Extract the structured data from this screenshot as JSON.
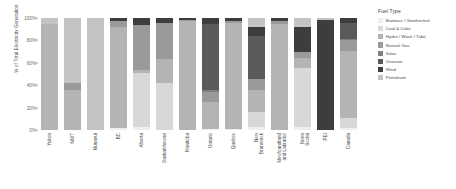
{
  "chart_data": {
    "type": "bar",
    "stacked": true,
    "stack_mode": "percent",
    "title": "",
    "xlabel": "",
    "ylabel": "% of Total Electricity Generation",
    "ylim": [
      0,
      100
    ],
    "ytick_labels": [
      "0%",
      "20%",
      "40%",
      "60%",
      "80%",
      "100%"
    ],
    "ytick_values": [
      0,
      20,
      40,
      60,
      80,
      100
    ],
    "grid": false,
    "legend_position": "right",
    "legend_title": "Fuel Type",
    "categories": [
      "Yukon",
      "NWT",
      "Nunavut",
      "BC",
      "Alberta",
      "Saskatchewan",
      "Manitoba",
      "Ontario",
      "Quebec",
      "New Brunswick",
      "Newfoundland and Labrador",
      "Nova Scotia",
      "PEI",
      "Canada"
    ],
    "series": [
      {
        "name": "Biomass / Geothermal",
        "color": "#efefef",
        "values": [
          0,
          0,
          0,
          2,
          3,
          0,
          0,
          1,
          1,
          3,
          0,
          3,
          0,
          2
        ]
      },
      {
        "name": "Coal & Coke",
        "color": "#d8d8d8",
        "values": [
          0,
          0,
          0,
          0,
          48,
          42,
          0,
          0,
          0,
          13,
          0,
          52,
          0,
          9
        ]
      },
      {
        "name": "Hydro / Wave / Tidal",
        "color": "#b4b4b4",
        "values": [
          95,
          36,
          0,
          90,
          3,
          21,
          97,
          24,
          95,
          20,
          95,
          9,
          0,
          60
        ]
      },
      {
        "name": "Natural Gas",
        "color": "#9a9a9a",
        "values": [
          0,
          6,
          0,
          5,
          40,
          33,
          1,
          9,
          1,
          10,
          2,
          6,
          0,
          9
        ]
      },
      {
        "name": "Solar",
        "color": "#7f7f7f",
        "values": [
          0,
          0,
          0,
          0,
          0,
          0,
          0,
          2,
          0,
          0,
          0,
          0,
          0,
          1
        ]
      },
      {
        "name": "Uranium",
        "color": "#5a5a5a",
        "values": [
          0,
          0,
          0,
          0,
          0,
          0,
          0,
          59,
          0,
          38,
          0,
          0,
          0,
          15
        ]
      },
      {
        "name": "Wind",
        "color": "#3d3d3d",
        "values": [
          0,
          0,
          0,
          3,
          6,
          4,
          2,
          5,
          3,
          8,
          3,
          22,
          98,
          4
        ]
      },
      {
        "name": "Petroleum",
        "color": "#c4c4c4",
        "values": [
          5,
          58,
          100,
          0,
          0,
          0,
          0,
          0,
          0,
          8,
          0,
          8,
          2,
          0
        ]
      }
    ]
  }
}
